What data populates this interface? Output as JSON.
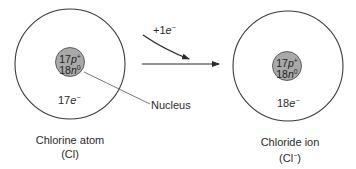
{
  "diagram": {
    "atom": {
      "nucleus_protons": "17",
      "nucleus_protons_unit": "p",
      "nucleus_protons_charge": "+",
      "nucleus_neutrons": "18",
      "nucleus_neutrons_unit": "n",
      "nucleus_neutrons_charge": "0",
      "electrons": "17",
      "electrons_unit": "e",
      "electrons_charge": "−",
      "caption_line1": "Chlorine atom",
      "caption_line2": "(Cl)"
    },
    "ion": {
      "nucleus_protons": "17",
      "nucleus_protons_unit": "p",
      "nucleus_protons_charge": "+",
      "nucleus_neutrons": "18",
      "nucleus_neutrons_unit": "n",
      "nucleus_neutrons_charge": "0",
      "electrons": "18",
      "electrons_unit": "e",
      "electrons_charge": "−",
      "caption_line1": "Chloride ion",
      "caption_line2_main": "(Cl",
      "caption_line2_charge": "−",
      "caption_line2_end": ")"
    },
    "reaction": {
      "electron_gain_prefix": "+1",
      "electron_gain_unit": "e",
      "electron_gain_charge": "−"
    },
    "callout": {
      "nucleus_label": "Nucleus"
    },
    "colors": {
      "line": "#3a3a3a",
      "nucleus_fill": "#a9a9a9",
      "background": "#ffffff"
    }
  }
}
